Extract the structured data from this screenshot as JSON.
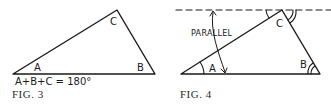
{
  "figures": [
    {
      "id": "fig3",
      "caption": "FIG. 3",
      "equation": "A+B+C = 180°",
      "vertex_labels": {
        "a": "A",
        "b": "B",
        "c": "C"
      }
    },
    {
      "id": "fig4",
      "caption": "FIG. 4",
      "annotation": "PARALLEL",
      "vertex_labels": {
        "a": "A",
        "b": "B",
        "c": "C"
      }
    }
  ],
  "colors": {
    "ink": "#1a1a1a",
    "background": "#ffffff"
  }
}
